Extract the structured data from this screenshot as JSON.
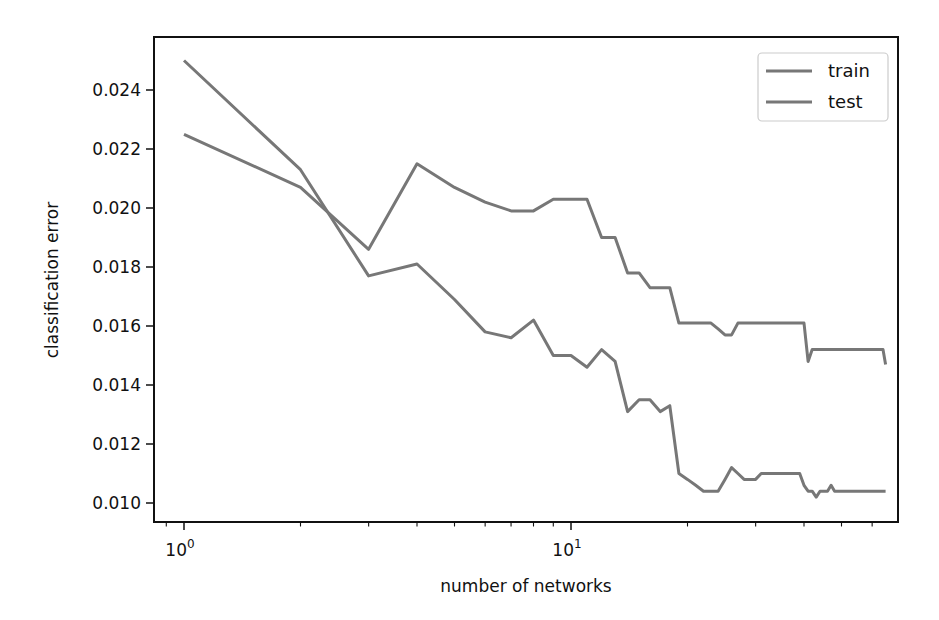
{
  "chart_data": {
    "type": "line",
    "title": "",
    "xlabel": "number of networks",
    "ylabel": "classification error",
    "xscale": "log",
    "xlim": [
      0.84,
      80
    ],
    "ylim": [
      0.0094,
      0.0257
    ],
    "grid": false,
    "legend_position": "upper right",
    "xticks": [
      {
        "value": 1,
        "label_base": "10",
        "label_exp": "0"
      },
      {
        "value": 10,
        "label_base": "10",
        "label_exp": "1"
      }
    ],
    "yticks": [
      0.01,
      0.012,
      0.014,
      0.016,
      0.018,
      0.02,
      0.022,
      0.024
    ],
    "ytick_labels": [
      "0.010",
      "0.012",
      "0.014",
      "0.016",
      "0.018",
      "0.020",
      "0.022",
      "0.024"
    ],
    "series": [
      {
        "name": "train",
        "color": "#777777",
        "x": [
          1,
          2,
          3,
          4,
          5,
          6,
          7,
          8,
          9,
          10,
          11,
          12,
          13,
          14,
          15,
          16,
          17,
          18,
          19,
          20,
          21,
          22,
          23,
          24,
          25,
          26,
          27,
          28,
          29,
          30,
          31,
          32,
          33,
          34,
          35,
          36,
          37,
          38,
          39,
          40,
          41,
          42,
          43,
          44,
          45,
          46,
          47,
          48,
          49,
          50,
          51,
          52,
          53,
          54,
          55,
          56,
          57,
          58,
          59,
          60,
          61,
          62,
          63,
          64,
          65
        ],
        "values": [
          0.025,
          0.0213,
          0.0177,
          0.0181,
          0.0169,
          0.0158,
          0.0156,
          0.0162,
          0.015,
          0.015,
          0.0146,
          0.0152,
          0.0148,
          0.0131,
          0.0135,
          0.0135,
          0.0131,
          0.0133,
          0.011,
          0.0108,
          0.0106,
          0.0104,
          0.0104,
          0.0104,
          0.0108,
          0.0112,
          0.011,
          0.0108,
          0.0108,
          0.0108,
          0.011,
          0.011,
          0.011,
          0.011,
          0.011,
          0.011,
          0.011,
          0.011,
          0.011,
          0.0106,
          0.0104,
          0.0104,
          0.0102,
          0.0104,
          0.0104,
          0.0104,
          0.0106,
          0.0104,
          0.0104,
          0.0104,
          0.0104,
          0.0104,
          0.0104,
          0.0104,
          0.0104,
          0.0104,
          0.0104,
          0.0104,
          0.0104,
          0.0104,
          0.0104,
          0.0104,
          0.0104,
          0.0104,
          0.0104
        ]
      },
      {
        "name": "test",
        "color": "#777777",
        "x": [
          1,
          2,
          3,
          4,
          5,
          6,
          7,
          8,
          9,
          10,
          11,
          12,
          13,
          14,
          15,
          16,
          17,
          18,
          19,
          20,
          21,
          22,
          23,
          24,
          25,
          26,
          27,
          28,
          29,
          30,
          31,
          32,
          33,
          34,
          35,
          36,
          37,
          38,
          39,
          40,
          41,
          42,
          43,
          44,
          45,
          46,
          47,
          48,
          49,
          50,
          51,
          52,
          53,
          54,
          55,
          56,
          57,
          58,
          59,
          60,
          61,
          62,
          63,
          64,
          65
        ],
        "values": [
          0.0225,
          0.0207,
          0.0186,
          0.0215,
          0.0207,
          0.0202,
          0.0199,
          0.0199,
          0.0203,
          0.0203,
          0.0203,
          0.019,
          0.019,
          0.0178,
          0.0178,
          0.0173,
          0.0173,
          0.0173,
          0.0161,
          0.0161,
          0.0161,
          0.0161,
          0.0161,
          0.0159,
          0.0157,
          0.0157,
          0.0161,
          0.0161,
          0.0161,
          0.0161,
          0.0161,
          0.0161,
          0.0161,
          0.0161,
          0.0161,
          0.0161,
          0.0161,
          0.0161,
          0.0161,
          0.0161,
          0.0148,
          0.0152,
          0.0152,
          0.0152,
          0.0152,
          0.0152,
          0.0152,
          0.0152,
          0.0152,
          0.0152,
          0.0152,
          0.0152,
          0.0152,
          0.0152,
          0.0152,
          0.0152,
          0.0152,
          0.0152,
          0.0152,
          0.0152,
          0.0152,
          0.0152,
          0.0152,
          0.0152,
          0.0147
        ]
      }
    ]
  }
}
